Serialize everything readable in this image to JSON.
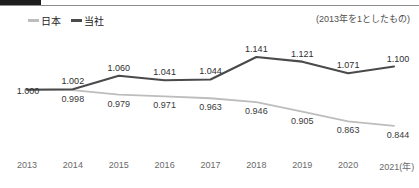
{
  "decor": {
    "tab_name": "header-tab-block",
    "rule_name": "header-rule"
  },
  "note": "(2013年を1としたもの)",
  "legend": [
    {
      "label": "日本",
      "color": "#bdbdbd",
      "key": "japan"
    },
    {
      "label": "当社",
      "color": "#4a4a4a",
      "key": "company"
    }
  ],
  "chart_data": {
    "type": "line",
    "title": "",
    "subtitle": "",
    "annotation": "(2013年を1としたもの)",
    "xlabel": "年",
    "ylabel": "",
    "grid": false,
    "legend_position": "top-left",
    "categories": [
      "2013",
      "2014",
      "2015",
      "2016",
      "2017",
      "2018",
      "2019",
      "2020",
      "2021"
    ],
    "x_tick_labels": [
      "2013",
      "2014",
      "2015",
      "2016",
      "2017",
      "2018",
      "2019",
      "2020",
      "2021(年)"
    ],
    "ylim": [
      0.8,
      1.18
    ],
    "series": [
      {
        "name": "当社",
        "color": "#4a4a4a",
        "values": [
          1.0,
          1.002,
          1.06,
          1.041,
          1.044,
          1.141,
          1.121,
          1.071,
          1.1
        ],
        "labels": [
          "1.000",
          "1.002",
          "1.060",
          "1.041",
          "1.044",
          "1.141",
          "1.121",
          "1.071",
          "1.100"
        ]
      },
      {
        "name": "日本",
        "color": "#bdbdbd",
        "values": [
          1.0,
          0.998,
          0.979,
          0.971,
          0.963,
          0.946,
          0.905,
          0.863,
          0.844
        ],
        "labels": [
          "1.000",
          "0.998",
          "0.979",
          "0.971",
          "0.963",
          "0.946",
          "0.905",
          "0.863",
          "0.844"
        ]
      }
    ]
  }
}
